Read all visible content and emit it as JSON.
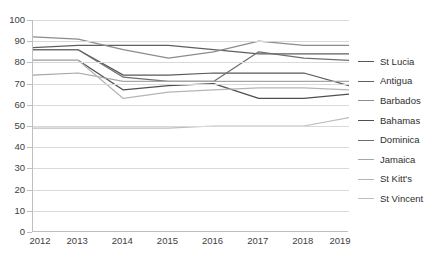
{
  "chart_data": {
    "type": "line",
    "title": "",
    "xlabel": "",
    "ylabel": "",
    "x": [
      "2012",
      "2013",
      "2014",
      "2015",
      "2016",
      "2017",
      "2018",
      "2019"
    ],
    "xlim": [
      2012,
      2019
    ],
    "ylim": [
      0,
      100
    ],
    "yticks": [
      0,
      10,
      20,
      30,
      40,
      50,
      60,
      70,
      80,
      90,
      100
    ],
    "grid": "horizontal",
    "legend_position": "right",
    "series": [
      {
        "name": "St Lucia",
        "color": "#595959",
        "values": [
          86,
          86,
          74,
          74,
          75,
          75,
          75,
          69
        ]
      },
      {
        "name": "Antigua",
        "color": "#5f5f5f",
        "values": [
          87,
          88,
          88,
          88,
          86,
          84,
          84,
          84
        ]
      },
      {
        "name": "Barbados",
        "color": "#8c8c8c",
        "values": [
          92,
          91,
          86,
          82,
          85,
          90,
          88,
          88
        ]
      },
      {
        "name": "Bahamas",
        "color": "#4f4f4f",
        "values": [
          81,
          81,
          67,
          69,
          70,
          63,
          63,
          65
        ]
      },
      {
        "name": "Dominica",
        "color": "#6e6e6e",
        "values": [
          86,
          86,
          73,
          71,
          71,
          85,
          82,
          81
        ]
      },
      {
        "name": "Jamaica",
        "color": "#a6a6a6",
        "values": [
          74,
          75,
          71,
          71,
          71,
          71,
          71,
          71
        ]
      },
      {
        "name": "St Kitt's",
        "color": "#b5b5b5",
        "values": [
          81,
          81,
          63,
          66,
          67,
          68,
          68,
          67
        ]
      },
      {
        "name": "St Vincent",
        "color": "#bdbdbd",
        "values": [
          49,
          49,
          49,
          49,
          50,
          50,
          50,
          54
        ]
      }
    ]
  }
}
